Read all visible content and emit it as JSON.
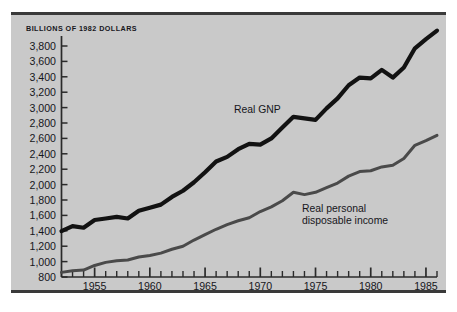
{
  "figure": {
    "title": "BILLIONS OF 1982 DOLLARS",
    "background_color": "#c9c9c9",
    "page_color": "#ffffff",
    "rule_color": "#3a3a3a"
  },
  "chart_data": {
    "type": "line",
    "title": "BILLIONS OF 1982 DOLLARS",
    "xlabel": "",
    "ylabel": "Billions of 1982 dollars",
    "xlim": [
      1952,
      1986
    ],
    "ylim": [
      800,
      3800
    ],
    "grid": false,
    "legend_position": "inline-annotation",
    "y_ticks": [
      800,
      1000,
      1200,
      1400,
      1600,
      1800,
      2000,
      2200,
      2400,
      2600,
      2800,
      3000,
      3200,
      3400,
      3600,
      3800
    ],
    "y_tick_labels": [
      "800",
      "1,000",
      "1,200",
      "1,400",
      "1,600",
      "1,800",
      "2,000",
      "2,200",
      "2,400",
      "2,600",
      "2,800",
      "3,000",
      "3,200",
      "3,400",
      "3,600",
      "3,800"
    ],
    "x_ticks": [
      1952,
      1953,
      1954,
      1955,
      1956,
      1957,
      1958,
      1959,
      1960,
      1961,
      1962,
      1963,
      1964,
      1965,
      1966,
      1967,
      1968,
      1969,
      1970,
      1971,
      1972,
      1973,
      1974,
      1975,
      1976,
      1977,
      1978,
      1979,
      1980,
      1981,
      1982,
      1983,
      1984,
      1985,
      1986
    ],
    "x_major_ticks": [
      1955,
      1960,
      1965,
      1970,
      1975,
      1980,
      1985
    ],
    "x_tick_labels": [
      "1955",
      "1960",
      "1965",
      "1970",
      "1975",
      "1980",
      "1985"
    ],
    "x": [
      1952,
      1953,
      1954,
      1955,
      1956,
      1957,
      1958,
      1959,
      1960,
      1961,
      1962,
      1963,
      1964,
      1965,
      1966,
      1967,
      1968,
      1969,
      1970,
      1971,
      1972,
      1973,
      1974,
      1975,
      1976,
      1977,
      1978,
      1979,
      1980,
      1981,
      1982,
      1983,
      1984,
      1985,
      1986
    ],
    "series": [
      {
        "name": "Real GNP",
        "color": "#121212",
        "width": 4.2,
        "label_lines": [
          "Real GNP"
        ],
        "values": [
          1395,
          1460,
          1440,
          1540,
          1560,
          1580,
          1560,
          1660,
          1700,
          1740,
          1840,
          1920,
          2030,
          2160,
          2300,
          2360,
          2460,
          2530,
          2520,
          2600,
          2740,
          2880,
          2860,
          2840,
          2990,
          3120,
          3290,
          3390,
          3380,
          3490,
          3390,
          3520,
          3770,
          3890,
          4000
        ]
      },
      {
        "name": "Real personal disposable income",
        "color": "#4a4a4a",
        "width": 3.0,
        "label_lines": [
          "Real personal",
          "disposable income"
        ],
        "values": [
          860,
          880,
          890,
          950,
          990,
          1010,
          1020,
          1060,
          1080,
          1110,
          1160,
          1200,
          1280,
          1350,
          1420,
          1480,
          1530,
          1570,
          1650,
          1710,
          1790,
          1900,
          1870,
          1900,
          1960,
          2020,
          2110,
          2170,
          2180,
          2230,
          2250,
          2340,
          2510,
          2570,
          2640
        ]
      }
    ],
    "annotations": [
      {
        "text": "Real GNP",
        "x": 1970.2,
        "y": 2880
      },
      {
        "text": "Real personal disposable income",
        "x": 1975.6,
        "y": 1680
      }
    ]
  },
  "axis": {
    "y_labels": [
      "3,800",
      "3,600",
      "3,400",
      "3,200",
      "3,000",
      "2,800",
      "2,600",
      "2,400",
      "2,200",
      "2,000",
      "1,800",
      "1,600",
      "1,400",
      "1,200",
      "1,000",
      "800"
    ],
    "x_labels": [
      "1955",
      "1960",
      "1965",
      "1970",
      "1975",
      "1980",
      "1985"
    ]
  },
  "labels": {
    "gnp": "Real GNP",
    "dpi_line1": "Real personal",
    "dpi_line2": "disposable income"
  }
}
